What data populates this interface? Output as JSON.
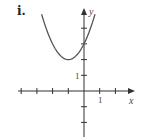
{
  "panel_label": "i.",
  "colors": {
    "axis": "#333333",
    "curve": "#555555"
  },
  "chart_data": {
    "type": "line",
    "title": "",
    "xlabel": "x",
    "ylabel": "y",
    "xlim": [
      -4.2,
      3.2
    ],
    "ylim": [
      -3,
      5.5
    ],
    "grid": false,
    "x_ticks": [
      -4,
      -3,
      -2,
      -1,
      1,
      2
    ],
    "y_ticks": [
      -2,
      -1,
      1,
      2,
      3,
      4
    ],
    "x_tick_labels": {
      "1": "1"
    },
    "y_tick_labels": {
      "1": "1"
    },
    "series": [
      {
        "name": "parabola",
        "equation": "y = (x + 1)^2 + 2",
        "vertex": [
          -1,
          2
        ],
        "y_intercept": [
          0,
          3
        ],
        "x": [
          -2.7,
          -2.5,
          -2,
          -1.5,
          -1,
          -0.5,
          0,
          0.5,
          0.7
        ],
        "values": [
          4.89,
          4.25,
          3,
          2.25,
          2,
          2.25,
          3,
          4.25,
          4.89
        ]
      }
    ]
  }
}
